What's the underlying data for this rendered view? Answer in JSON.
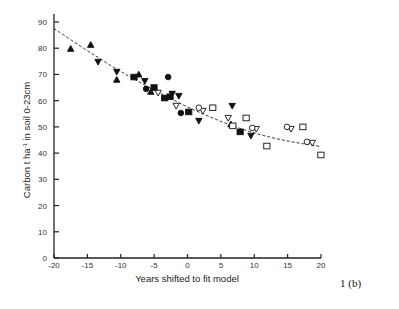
{
  "figure_label": "1 (b)",
  "chart_data": {
    "type": "scatter",
    "title": "",
    "xlabel": "Years shifted to fit model",
    "ylabel": "Carbon t ha⁻¹ in soil 0-23cm",
    "xlim": [
      -20,
      20
    ],
    "ylim": [
      0,
      90
    ],
    "xticks": [
      -20,
      -15,
      -10,
      -5,
      0,
      5,
      10,
      15,
      20
    ],
    "yticks": [
      0,
      10,
      20,
      30,
      40,
      50,
      60,
      70,
      80,
      90
    ],
    "grid": false,
    "legend": null,
    "series": [
      {
        "name": "filled-triangle-up",
        "marker": "triangle-up",
        "filled": true,
        "points": [
          [
            -17.5,
            79.8
          ],
          [
            -14.5,
            81.3
          ],
          [
            -10.6,
            68
          ],
          [
            -7.3,
            70
          ],
          [
            -5.5,
            63.4
          ],
          [
            6.5,
            51
          ]
        ]
      },
      {
        "name": "filled-triangle-down",
        "marker": "triangle-down",
        "filled": true,
        "points": [
          [
            -13.4,
            74.8
          ],
          [
            -10.6,
            71
          ],
          [
            -6.4,
            67.5
          ],
          [
            -2.3,
            62.6
          ],
          [
            -1.3,
            61.8
          ],
          [
            1.7,
            52.3
          ],
          [
            6.7,
            58
          ],
          [
            9.5,
            46.6
          ]
        ]
      },
      {
        "name": "filled-square",
        "marker": "square",
        "filled": true,
        "points": [
          [
            -8,
            69
          ],
          [
            -5,
            65
          ],
          [
            -3.4,
            61
          ],
          [
            -2.6,
            61.5
          ],
          [
            0.2,
            55.7
          ],
          [
            7.9,
            48.1
          ]
        ]
      },
      {
        "name": "filled-circle",
        "marker": "circle",
        "filled": true,
        "points": [
          [
            -2.9,
            69
          ],
          [
            -6.2,
            64.5
          ],
          [
            -1,
            55.3
          ]
        ]
      },
      {
        "name": "open-triangle-down",
        "marker": "triangle-down",
        "filled": false,
        "points": [
          [
            -4.4,
            63
          ],
          [
            -1.7,
            58
          ],
          [
            2.3,
            56.1
          ],
          [
            6.1,
            53.4
          ],
          [
            10.3,
            49.2
          ],
          [
            15.5,
            49.2
          ],
          [
            18.7,
            43.9
          ]
        ]
      },
      {
        "name": "open-circle",
        "marker": "circle",
        "filled": false,
        "points": [
          [
            1.7,
            57.3
          ],
          [
            9.7,
            49.6
          ],
          [
            14.9,
            50
          ],
          [
            17.9,
            44.3
          ]
        ]
      },
      {
        "name": "open-square",
        "marker": "square",
        "filled": false,
        "points": [
          [
            3.8,
            57.3
          ],
          [
            8.8,
            53.4
          ],
          [
            6.8,
            50.4
          ],
          [
            11.9,
            42.7
          ],
          [
            17.3,
            50
          ],
          [
            20,
            39.3
          ]
        ]
      }
    ],
    "fit_line": {
      "style": "dashed",
      "points": [
        [
          -20,
          87.5
        ],
        [
          -15,
          79
        ],
        [
          -10,
          71
        ],
        [
          -5,
          64
        ],
        [
          0,
          57.5
        ],
        [
          5,
          52
        ],
        [
          10,
          47.5
        ],
        [
          15,
          44.5
        ],
        [
          20,
          42.5
        ]
      ]
    }
  }
}
